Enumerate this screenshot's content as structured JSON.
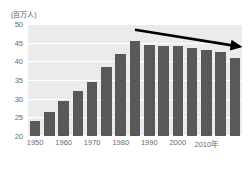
{
  "chart_data": {
    "type": "bar",
    "title": "",
    "subtitle": "",
    "unit_label": "(百万人)",
    "xlabel": "",
    "ylabel": "",
    "ylim": [
      20,
      50
    ],
    "ytick_labels": [
      "50",
      "45",
      "40",
      "35",
      "30",
      "25",
      "20"
    ],
    "ytick_values": [
      50,
      45,
      40,
      35,
      30,
      25,
      20
    ],
    "grid": true,
    "legend": "none",
    "bar_color": "#595959",
    "plot_background": "#ebebeb",
    "gridline_color": "#ffffff",
    "text_color": "#6b6b6b",
    "categories": [
      "1950",
      "1955",
      "1960",
      "1965",
      "1970",
      "1975",
      "1980",
      "1985",
      "1990",
      "1995",
      "2000",
      "2005",
      "2010",
      "2015",
      "2020"
    ],
    "values": [
      24.0,
      26.5,
      29.5,
      32.0,
      34.5,
      38.5,
      42.0,
      45.5,
      44.5,
      44.0,
      44.0,
      43.5,
      43.0,
      42.5,
      41.0
    ],
    "xtick_labels": [
      "1950",
      "1960",
      "1970",
      "1980",
      "1990",
      "2000",
      "2010年"
    ],
    "xtick_categories": [
      "1950",
      "1960",
      "1970",
      "1980",
      "1990",
      "2000",
      "2010"
    ],
    "annotations": [
      {
        "name": "declining-trend-arrow",
        "type": "arrow",
        "color": "#000000",
        "from_category": "1985",
        "to_category": "2020",
        "description": "downward trend arrow over the post-peak bars"
      }
    ]
  }
}
